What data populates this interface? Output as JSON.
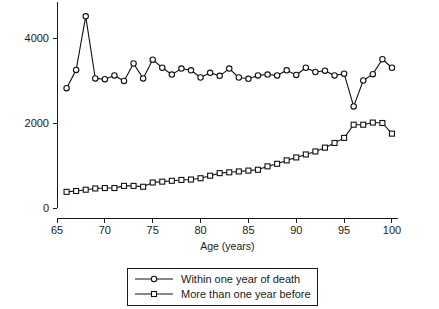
{
  "chart_data": {
    "type": "line",
    "title": "",
    "subtitle": "",
    "xlabel": "Age (years)",
    "ylabel": "",
    "xlim": [
      64,
      101
    ],
    "ylim": [
      0,
      4800
    ],
    "grid": false,
    "legend_position": "bottom",
    "x_ticks": [
      65,
      70,
      75,
      80,
      85,
      90,
      95,
      100
    ],
    "x_tick_labels": [
      "65",
      "70",
      "75",
      "80",
      "85",
      "90",
      "95",
      "100"
    ],
    "y_ticks": [
      0,
      2000,
      4000
    ],
    "y_tick_labels": [
      "0",
      "2000",
      "4000"
    ],
    "x": [
      66,
      67,
      68,
      69,
      70,
      71,
      72,
      73,
      74,
      75,
      76,
      77,
      78,
      79,
      80,
      81,
      82,
      83,
      84,
      85,
      86,
      87,
      88,
      89,
      90,
      91,
      92,
      93,
      94,
      95,
      96,
      97,
      98,
      99,
      100
    ],
    "series": [
      {
        "name": "Within one year of death",
        "marker": "circle",
        "values": [
          2820,
          3250,
          4510,
          3050,
          3030,
          3120,
          2990,
          3400,
          3050,
          3490,
          3300,
          3140,
          3280,
          3240,
          3070,
          3180,
          3110,
          3280,
          3070,
          3040,
          3120,
          3140,
          3120,
          3240,
          3130,
          3300,
          3200,
          3230,
          3120,
          3160,
          2390,
          3000,
          3150,
          3500,
          3300
        ]
      },
      {
        "name": "More than one year before",
        "marker": "square",
        "values": [
          380,
          400,
          430,
          460,
          470,
          470,
          520,
          520,
          500,
          600,
          620,
          640,
          660,
          670,
          700,
          760,
          820,
          840,
          860,
          880,
          900,
          980,
          1040,
          1120,
          1190,
          1260,
          1330,
          1420,
          1530,
          1650,
          1960,
          1960,
          2010,
          2000,
          1750
        ]
      }
    ]
  },
  "legend": {
    "entries": [
      {
        "label": "Within one year of death",
        "marker": "circle"
      },
      {
        "label": "More than one year before",
        "marker": "square"
      }
    ]
  }
}
